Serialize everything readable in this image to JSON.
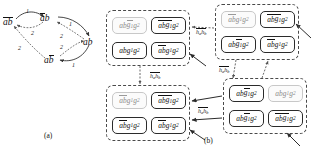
{
  "figure": {
    "panel_a": {
      "caption": "(a)",
      "nodes": [
        {
          "id": "n-ab-bar-both",
          "text": "ab",
          "overline": "both",
          "x": 3,
          "y": 18
        },
        {
          "id": "n-ab-bar-a",
          "text": "ab",
          "overline": "first",
          "x": 40,
          "y": 14
        },
        {
          "id": "n-ab-plain",
          "text": "ab",
          "overline": "none",
          "x": 83,
          "y": 38
        },
        {
          "id": "n-ab-bar-b",
          "text": "ab",
          "overline": "second",
          "x": 44,
          "y": 56
        }
      ],
      "edge_labels": [
        {
          "value": "1",
          "x": 26,
          "y": 8
        },
        {
          "value": "2",
          "x": 31,
          "y": 30
        },
        {
          "value": "1",
          "x": 69,
          "y": 21
        },
        {
          "value": "2",
          "x": 60,
          "y": 33
        },
        {
          "value": "2",
          "x": 60,
          "y": 44
        },
        {
          "value": "2",
          "x": 18,
          "y": 45
        },
        {
          "value": "1",
          "x": 72,
          "y": 62
        }
      ]
    },
    "panel_b": {
      "caption": "(b)",
      "cell_base": "ab",
      "cell_sub1": "g",
      "cell_sub1_index": "1",
      "cell_sub2": "g",
      "cell_sub2_index": "2",
      "transition_label_h": "h",
      "transition_label_a": "a",
      "transition_label_b": "b",
      "groups": [
        {
          "id": "group-top-left",
          "x": 106,
          "y": 10,
          "w": 84,
          "h": 56,
          "cells": [
            {
              "pos": "tl",
              "style": "faint",
              "bars": [
                "g1"
              ]
            },
            {
              "pos": "tr",
              "style": "strong",
              "bars": [
                "ab",
                "g1"
              ]
            },
            {
              "pos": "bl",
              "style": "strong",
              "bars": []
            },
            {
              "pos": "br",
              "style": "strong",
              "bars": [
                "ab"
              ]
            }
          ]
        },
        {
          "id": "group-top-right",
          "x": 215,
          "y": 4,
          "w": 84,
          "h": 56,
          "cells": [
            {
              "pos": "tl",
              "style": "faint",
              "bars": [
                "ab"
              ]
            },
            {
              "pos": "tr",
              "style": "strong",
              "bars": [
                "ab",
                "g1"
              ]
            },
            {
              "pos": "bl",
              "style": "strong",
              "bars": [
                "g1"
              ]
            },
            {
              "pos": "br",
              "style": "strong",
              "bars": [
                "ab"
              ]
            }
          ]
        },
        {
          "id": "group-bottom-left",
          "x": 106,
          "y": 85,
          "w": 84,
          "h": 56,
          "cells": [
            {
              "pos": "tl",
              "style": "faint",
              "bars": [
                "ab"
              ]
            },
            {
              "pos": "tr",
              "style": "strong",
              "bars": [
                "ab",
                "g1"
              ]
            },
            {
              "pos": "bl",
              "style": "strong",
              "bars": [
                "ab"
              ]
            },
            {
              "pos": "br",
              "style": "strong",
              "bars": [
                "ab"
              ]
            }
          ]
        },
        {
          "id": "group-bottom-right",
          "x": 223,
          "y": 78,
          "w": 84,
          "h": 56,
          "cells": [
            {
              "pos": "tl",
              "style": "strong",
              "bars": [
                "g1"
              ]
            },
            {
              "pos": "tr",
              "style": "faint",
              "bars": []
            },
            {
              "pos": "bl",
              "style": "strong",
              "bars": [
                "g1"
              ]
            },
            {
              "pos": "br",
              "style": "strong",
              "bars": [
                "ab",
                "g1"
              ]
            }
          ]
        }
      ],
      "transitions": [
        {
          "id": "t-top",
          "x": 196,
          "y": 29
        },
        {
          "id": "t-left-down",
          "x": 150,
          "y": 73
        },
        {
          "id": "t-middle-diag",
          "x": 219,
          "y": 67
        },
        {
          "id": "t-bottom",
          "x": 198,
          "y": 108
        }
      ]
    }
  },
  "colors": {
    "ink": "#1a1a1a",
    "group_border": "#4a4a4a",
    "cell_strong": "#2b2b2b",
    "cell_faint": "#c8c8c8",
    "arrow": "#3a3a3a",
    "background": "#ffffff"
  }
}
